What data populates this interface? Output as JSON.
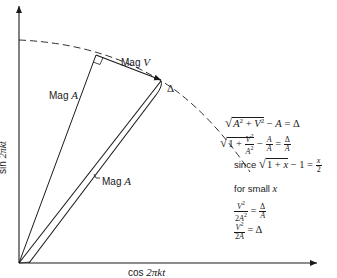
{
  "axes": {
    "x_label": "cos 2πkt",
    "x_label_fn": "cos",
    "x_label_arg": "2πkt",
    "y_label": "sin 2πkt",
    "y_label_fn": "sin",
    "y_label_arg": "2πkt"
  },
  "labels": {
    "mag_a_upper": "Mag",
    "mag_a_upper_var": "A",
    "mag_v": "Mag",
    "mag_v_var": "V",
    "delta": "Δ",
    "mag_a_lower": "Mag",
    "mag_a_lower_var": "A"
  },
  "equations": {
    "line1": "√(A² + V²) − A = Δ",
    "line2": "√(1 + V²/A²) − A/A = Δ/A",
    "line3_prefix": "since",
    "line3": "√(1 + x) − 1 = x/2",
    "line4_prefix": "for small",
    "line4_var": "x",
    "line5": "V²/(2A²) = Δ/A",
    "line6": "V²/(2A) = Δ"
  },
  "colors": {
    "ink": "#1a1a1a",
    "background": "#ffffff"
  }
}
